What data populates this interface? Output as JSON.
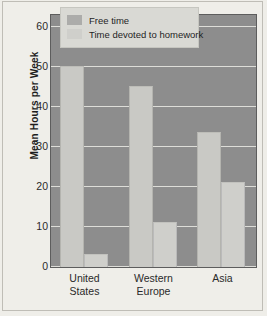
{
  "chart_data": {
    "type": "bar",
    "title": "",
    "xlabel": "",
    "ylabel": "Mean Hours per Week",
    "categories": [
      "United States",
      "Western Europe",
      "Asia"
    ],
    "category_lines": [
      [
        "United",
        "States"
      ],
      [
        "Western",
        "Europe"
      ],
      [
        "Asia"
      ]
    ],
    "series": [
      {
        "name": "Free time",
        "values": [
          50,
          45,
          33.5
        ],
        "color": "#c9c9c5"
      },
      {
        "name": "Time devoted to homework",
        "values": [
          3,
          11,
          21
        ],
        "color": "#cfcfcb"
      }
    ],
    "ylim": [
      0,
      63
    ],
    "yticks": [
      0,
      10,
      20,
      30,
      40,
      50,
      60
    ],
    "ytick_labels": [
      "0",
      "10",
      "20",
      "30",
      "40",
      "50",
      "60"
    ],
    "grid": true,
    "grid_axis": "y",
    "legend_position": "top-center",
    "plot_background": "#8d8d8d",
    "figure_background": "#efeee9",
    "grid_color": "#ddddd8"
  }
}
